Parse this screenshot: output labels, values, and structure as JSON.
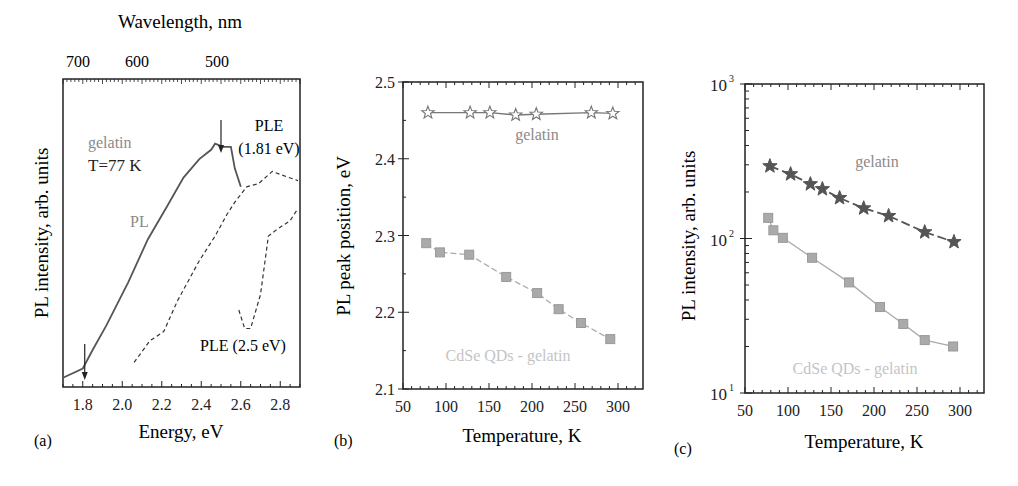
{
  "figure": {
    "panels": [
      {
        "id": "a",
        "panel_label": "(a)",
        "top_axis_label": "Wavelength, nm",
        "top_ticks": [
          "700",
          "600",
          "500"
        ],
        "xlabel": "Energy, eV",
        "ylabel": "PL intensity, arb. units",
        "annotations": {
          "sample": "gelatin",
          "temperature": "T=77 K",
          "pl": "PL",
          "ple1_line1": "PLE",
          "ple1_line2": "(1.81 eV)",
          "ple2": "PLE (2.5 eV)"
        }
      },
      {
        "id": "b",
        "panel_label": "(b)",
        "xlabel": "Temperature, K",
        "ylabel": "PL peak position, eV",
        "annotations": {
          "top_series": "gelatin",
          "bottom_series": "CdSe QDs - gelatin"
        }
      },
      {
        "id": "c",
        "panel_label": "(c)",
        "xlabel": "Temperature, K",
        "ylabel": "PL intensity, arb. units",
        "annotations": {
          "top_series": "gelatin",
          "bottom_series": "CdSe QDs - gelatin"
        }
      }
    ],
    "colors": {
      "axis": "#222222",
      "dark_series": "#555555",
      "light_series": "#aaaaaa",
      "label_light": "#c4c4c4",
      "label_mid": "#8a8a8a"
    }
  },
  "chart_data": [
    {
      "type": "line",
      "title": "",
      "xlabel": "Energy, eV",
      "ylabel": "PL intensity, arb. units",
      "secondary_xlabel": "Wavelength, nm",
      "secondary_x_ticks": [
        700,
        600,
        500
      ],
      "xlim": [
        1.7,
        2.9
      ],
      "ylim": [
        0,
        1
      ],
      "x_ticks": [
        1.8,
        2.0,
        2.2,
        2.4,
        2.6,
        2.8
      ],
      "x_tick_labels": [
        "1.8",
        "2.0",
        "2.2",
        "2.4",
        "2.6",
        "2.8"
      ],
      "grid": false,
      "annotations": [
        "gelatin",
        "T=77 K",
        "PL",
        "PLE (1.81 eV)",
        "PLE (2.5 eV)"
      ],
      "arrows_at_eV": [
        1.81,
        2.5
      ],
      "series": [
        {
          "name": "PL",
          "style": "solid",
          "x": [
            1.7,
            1.8,
            1.85,
            1.92,
            2.03,
            2.13,
            2.23,
            2.31,
            2.39,
            2.45,
            2.47,
            2.51,
            2.55,
            2.57,
            2.6
          ],
          "y": [
            0.03,
            0.06,
            0.12,
            0.2,
            0.34,
            0.48,
            0.59,
            0.68,
            0.74,
            0.77,
            0.79,
            0.78,
            0.78,
            0.71,
            0.65
          ]
        },
        {
          "name": "PLE (1.81 eV)",
          "style": "dashed",
          "x": [
            2.06,
            2.14,
            2.21,
            2.28,
            2.39,
            2.47,
            2.53,
            2.57,
            2.63,
            2.69,
            2.76,
            2.8,
            2.89
          ],
          "y": [
            0.08,
            0.15,
            0.18,
            0.28,
            0.41,
            0.49,
            0.56,
            0.6,
            0.65,
            0.66,
            0.7,
            0.69,
            0.67
          ]
        },
        {
          "name": "PLE (2.5 eV)",
          "style": "dashed",
          "x": [
            2.59,
            2.62,
            2.65,
            2.7,
            2.74,
            2.78,
            2.85,
            2.89
          ],
          "y": [
            0.25,
            0.19,
            0.19,
            0.3,
            0.49,
            0.51,
            0.54,
            0.58
          ]
        }
      ]
    },
    {
      "type": "line",
      "title": "",
      "xlabel": "Temperature, K",
      "ylabel": "PL peak position, eV",
      "xlim": [
        50,
        325
      ],
      "ylim": [
        2.1,
        2.5
      ],
      "x_ticks": [
        50,
        100,
        150,
        200,
        250,
        300
      ],
      "y_ticks": [
        2.1,
        2.2,
        2.3,
        2.4,
        2.5
      ],
      "grid": false,
      "series": [
        {
          "name": "gelatin",
          "marker": "open-star",
          "x": [
            79,
            128,
            151,
            181,
            205,
            269,
            294
          ],
          "y": [
            2.46,
            2.46,
            2.46,
            2.457,
            2.458,
            2.46,
            2.459
          ]
        },
        {
          "name": "CdSe QDs - gelatin",
          "marker": "filled-square",
          "x": [
            77,
            93,
            127,
            170,
            206,
            231,
            257,
            291
          ],
          "y": [
            2.29,
            2.278,
            2.275,
            2.246,
            2.225,
            2.204,
            2.186,
            2.165
          ]
        }
      ]
    },
    {
      "type": "line",
      "title": "",
      "xlabel": "Temperature, K",
      "ylabel": "PL intensity, arb. units",
      "yscale": "log",
      "xlim": [
        50,
        325
      ],
      "ylim": [
        10,
        1000
      ],
      "x_ticks": [
        50,
        100,
        150,
        200,
        250,
        300
      ],
      "y_ticks": [
        10,
        100,
        1000
      ],
      "y_tick_labels": [
        "10^1",
        "10^2",
        "10^3"
      ],
      "grid": false,
      "series": [
        {
          "name": "gelatin",
          "marker": "filled-star",
          "x": [
            79,
            103,
            126,
            140,
            160,
            188,
            217,
            259,
            293
          ],
          "y": [
            294,
            261,
            225,
            209,
            183,
            157,
            140,
            110,
            95
          ]
        },
        {
          "name": "CdSe QDs - gelatin",
          "marker": "filled-square",
          "x": [
            77,
            83,
            94,
            128,
            171,
            207,
            234,
            259,
            292
          ],
          "y": [
            136,
            113,
            101,
            75,
            52,
            36,
            28,
            22,
            20
          ]
        }
      ]
    }
  ]
}
